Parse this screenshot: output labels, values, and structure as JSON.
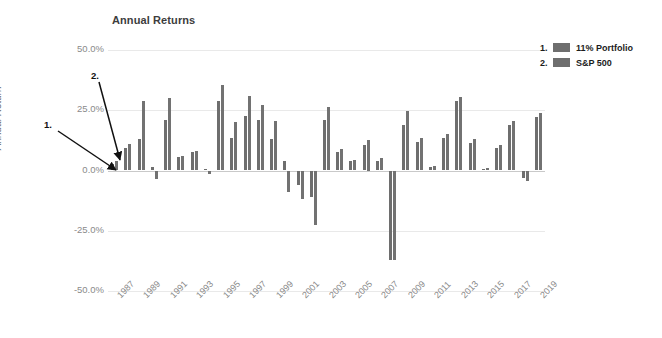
{
  "chart_data": {
    "type": "bar",
    "title": "Annual Returns",
    "xlabel": "",
    "ylabel": "Annual Return",
    "ylim": [
      -50,
      50
    ],
    "ytick_labels": [
      "50.0%",
      "25.0%",
      "0.0%",
      "-25.0%",
      "-50.0%"
    ],
    "ytick_values": [
      50,
      25,
      0,
      -25,
      -50
    ],
    "grid": true,
    "legend_position": "top-right",
    "categories": [
      1987,
      1988,
      1989,
      1990,
      1991,
      1992,
      1993,
      1994,
      1995,
      1996,
      1997,
      1998,
      1999,
      2000,
      2001,
      2002,
      2003,
      2004,
      2005,
      2006,
      2007,
      2008,
      2009,
      2010,
      2011,
      2012,
      2013,
      2014,
      2015,
      2016,
      2017,
      2018,
      2019
    ],
    "xtick_labels": [
      "1987",
      "1989",
      "1991",
      "1993",
      "1995",
      "1997",
      "1999",
      "2001",
      "2003",
      "2005",
      "2007",
      "2009",
      "2011",
      "2013",
      "2015",
      "2017",
      "2019"
    ],
    "series": [
      {
        "name": "11% Portfolio",
        "color": "#6e6e6e",
        "values": [
          2.5,
          9.5,
          13.0,
          1.5,
          21.0,
          5.5,
          7.5,
          0.5,
          29.0,
          13.5,
          22.5,
          21.0,
          13.0,
          4.0,
          -6.0,
          -11.0,
          21.0,
          7.5,
          4.0,
          10.5,
          4.0,
          -37.0,
          19.0,
          12.0,
          1.5,
          13.5,
          29.0,
          11.5,
          0.5,
          9.5,
          19.0,
          -3.0,
          22.0
        ]
      },
      {
        "name": "S&P 500",
        "color": "#727272",
        "values": [
          4.0,
          11.0,
          29.0,
          -3.5,
          30.0,
          6.0,
          8.0,
          -1.5,
          35.5,
          20.0,
          31.0,
          27.0,
          20.5,
          -9.0,
          -12.0,
          -22.5,
          26.5,
          9.0,
          4.5,
          12.5,
          5.0,
          -37.0,
          24.5,
          13.5,
          2.0,
          15.0,
          30.5,
          13.0,
          1.0,
          10.5,
          20.5,
          -4.5,
          24.0
        ]
      }
    ],
    "annotations": [
      {
        "id": "1.",
        "target_series": "11% Portfolio"
      },
      {
        "id": "2.",
        "target_series": "S&P 500"
      }
    ]
  },
  "legend": {
    "entries": [
      {
        "number": "1.",
        "label": "11% Portfolio"
      },
      {
        "number": "2.",
        "label": "S&P 500"
      }
    ]
  }
}
